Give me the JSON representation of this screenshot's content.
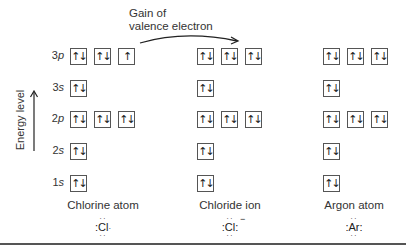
{
  "annotation": {
    "gain_line1": "Gain of",
    "gain_line2": "valence electron"
  },
  "axis": {
    "label": "Energy level",
    "arrow_icon": "up-arrow"
  },
  "orbitals": [
    {
      "id": "3p",
      "num": "3",
      "letter": "p",
      "y": 48
    },
    {
      "id": "3s",
      "num": "3",
      "letter": "s",
      "y": 80
    },
    {
      "id": "2p",
      "num": "2",
      "letter": "p",
      "y": 111
    },
    {
      "id": "2s",
      "num": "2",
      "letter": "s",
      "y": 143
    },
    {
      "id": "1s",
      "num": "1",
      "letter": "s",
      "y": 175
    }
  ],
  "columns": [
    {
      "name": "Chlorine atom",
      "symbol": "Cl",
      "charge": "",
      "x": [
        70,
        94,
        118
      ],
      "boxes": {
        "3p": [
          "↑↓",
          "↑↓",
          "↑"
        ],
        "3s": [
          "↑↓"
        ],
        "2p": [
          "↑↓",
          "↑↓",
          "↑↓"
        ],
        "2s": [
          "↑↓"
        ],
        "1s": [
          "↑↓"
        ]
      }
    },
    {
      "name": "Chloride ion",
      "symbol": "Cl",
      "charge": "−",
      "x": [
        197,
        221,
        245
      ],
      "boxes": {
        "3p": [
          "↑↓",
          "↑↓",
          "↑↓"
        ],
        "3s": [
          "↑↓"
        ],
        "2p": [
          "↑↓",
          "↑↓",
          "↑↓"
        ],
        "2s": [
          "↑↓"
        ],
        "1s": [
          "↑↓"
        ]
      }
    },
    {
      "name": "Argon atom",
      "symbol": "Ar",
      "charge": "",
      "x": [
        323,
        347,
        371
      ],
      "boxes": {
        "3p": [
          "↑↓",
          "↑↓",
          "↑↓"
        ],
        "3s": [
          "↑↓"
        ],
        "2p": [
          "↑↓",
          "↑↓",
          "↑↓"
        ],
        "2s": [
          "↑↓"
        ],
        "1s": [
          "↑↓"
        ]
      }
    }
  ],
  "labels": {
    "chlorine_caption": "Chlorine atom",
    "chloride_caption": "Chloride ion",
    "argon_caption": "Argon atom",
    "cl_symbol": "Cl",
    "cl_ion_symbol": "Cl",
    "cl_ion_charge": "−",
    "ar_symbol": "Ar",
    "dots_pair": ":",
    "dots_top": "··",
    "dots_bot": "··"
  },
  "colors": {
    "line": "#555555",
    "text": "#333333",
    "background": "#ffffff"
  }
}
